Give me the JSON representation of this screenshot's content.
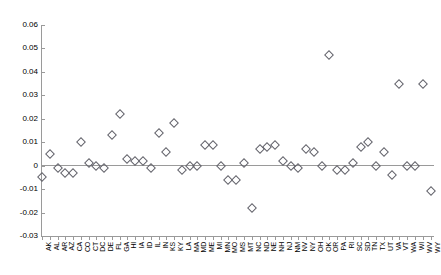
{
  "chart_data": {
    "type": "scatter",
    "title": "",
    "subtitle": "",
    "xlabel": "",
    "ylabel": "",
    "grid": false,
    "legend": "none",
    "marker": "open-diamond",
    "marker_color": "#63636b",
    "axis_color": "#9a9a9a",
    "zero_line": 0,
    "ylim": [
      -0.03,
      0.06
    ],
    "ytick_labels": [
      "0.06",
      "0.05",
      "0.04",
      "0.03",
      "0.02",
      "0.01",
      "0",
      "-0.01",
      "-0.02",
      "-0.03"
    ],
    "yticks": [
      0.06,
      0.05,
      0.04,
      0.03,
      0.02,
      0.01,
      0,
      -0.01,
      -0.02,
      -0.03
    ],
    "categories": [
      "AK",
      "AL",
      "AR",
      "AZ",
      "CA",
      "CO",
      "CT",
      "DC",
      "DE",
      "FL",
      "GA",
      "HI",
      "IA",
      "ID",
      "IL",
      "IN",
      "KS",
      "KY",
      "LA",
      "MA",
      "MD",
      "ME",
      "MI",
      "MN",
      "MO",
      "MS",
      "MT",
      "NC",
      "ND",
      "NE",
      "NH",
      "NJ",
      "NM",
      "NV",
      "NY",
      "OH",
      "OK",
      "OR",
      "PA",
      "RI",
      "SC",
      "SD",
      "TN",
      "TX",
      "UT",
      "VA",
      "VT",
      "WA",
      "WI",
      "WV",
      "WY"
    ],
    "values": [
      -0.005,
      0.005,
      -0.001,
      -0.003,
      -0.003,
      0.01,
      0.001,
      0.0,
      -0.001,
      0.013,
      0.022,
      0.003,
      0.002,
      0.002,
      -0.001,
      0.014,
      0.006,
      0.018,
      -0.002,
      0.0,
      0.0,
      0.009,
      0.009,
      0.0,
      -0.006,
      -0.006,
      0.001,
      -0.018,
      0.007,
      0.008,
      0.009,
      0.002,
      0.0,
      -0.001,
      0.007,
      0.006,
      0.0,
      0.047,
      -0.002,
      -0.002,
      0.001,
      0.008,
      0.01,
      0.0,
      0.006,
      -0.004,
      0.035,
      0.0,
      0.0,
      0.035,
      -0.011
    ]
  },
  "plot": {
    "x_start_px": 42,
    "x_step_px": 7.77,
    "y_top_px": 25,
    "y_top_value": 0.06,
    "y_px_per_unit": 2344.4
  }
}
